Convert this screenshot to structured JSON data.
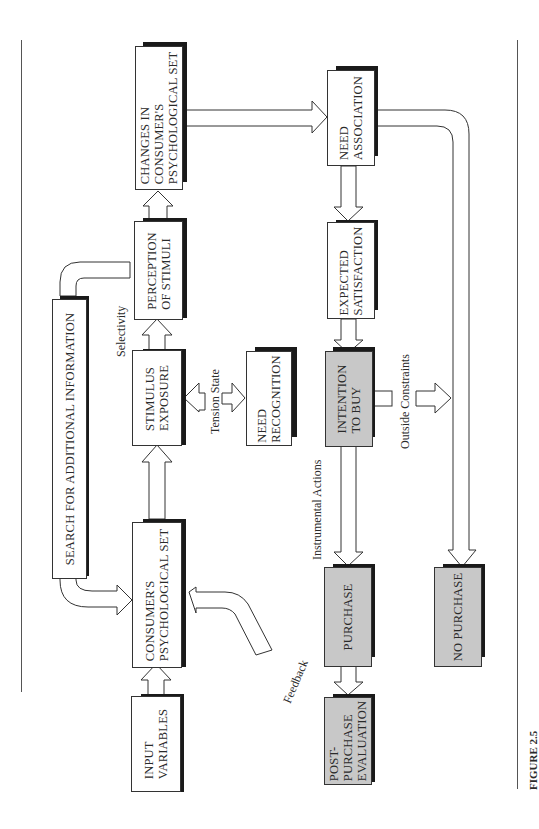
{
  "figure": {
    "caption": "FIGURE 2.5",
    "orientation": "rotated 90° (text reads bottom-to-top)",
    "colors": {
      "highlight_fill": "#c8c8c8",
      "shadow": "#1a1a1a",
      "line": "#333333"
    }
  },
  "nodes": {
    "input_variables": "INPUT\nVARIABLES",
    "consumers_psych_set": "CONSUMER'S\nPSYCHOLOGICAL SET",
    "stimulus_exposure": "STIMULUS\nEXPOSURE",
    "perception_of_stimuli": "PERCEPTION\nOF STIMULI",
    "changes_in_psych_set": "CHANGES IN\nCONSUMER'S\nPSYCHOLOGICAL SET",
    "search_for_info": "SEARCH FOR ADDITIONAL INFORMATION",
    "need_recognition": "NEED\nRECOGNITION",
    "need_association": "NEED\nASSOCIATION",
    "expected_satisfaction": "EXPECTED\nSATISFACTION",
    "intention_to_buy": "INTENTION\nTO BUY",
    "purchase": "PURCHASE",
    "post_purchase_evaluation": "POST-\nPURCHASE\nEVALUATION",
    "no_purchase": "NO PURCHASE"
  },
  "labels": {
    "selectivity": "Selectivity",
    "tension_state": "Tension State",
    "outside_constraints": "Outside Constraints",
    "instrumental_actions": "Instrumental Actions",
    "feedback": "Feedback"
  },
  "edges": [
    {
      "from": "INPUT VARIABLES",
      "to": "CONSUMER'S PSYCHOLOGICAL SET"
    },
    {
      "from": "CONSUMER'S PSYCHOLOGICAL SET",
      "to": "STIMULUS EXPOSURE"
    },
    {
      "from": "STIMULUS EXPOSURE",
      "to": "PERCEPTION OF STIMULI",
      "label": "Selectivity"
    },
    {
      "from": "STIMULUS EXPOSURE",
      "to": "NEED RECOGNITION",
      "label": "Tension State",
      "bidirectional": true
    },
    {
      "from": "PERCEPTION OF STIMULI",
      "to": "CHANGES IN CONSUMER'S PSYCHOLOGICAL SET"
    },
    {
      "from": "PERCEPTION OF STIMULI",
      "to": "CONSUMER'S PSYCHOLOGICAL SET",
      "via": "SEARCH FOR ADDITIONAL INFORMATION"
    },
    {
      "from": "CHANGES IN CONSUMER'S PSYCHOLOGICAL SET",
      "to": "NEED ASSOCIATION"
    },
    {
      "from": "NEED ASSOCIATION",
      "to": "EXPECTED SATISFACTION"
    },
    {
      "from": "NEED ASSOCIATION",
      "to": "NO PURCHASE"
    },
    {
      "from": "EXPECTED SATISFACTION",
      "to": "INTENTION TO BUY"
    },
    {
      "from": "INTENTION TO BUY",
      "to": "PURCHASE",
      "label": "Instrumental Actions"
    },
    {
      "from": "INTENTION TO BUY",
      "to": "NO PURCHASE",
      "label": "Outside Constraints"
    },
    {
      "from": "PURCHASE",
      "to": "POST-PURCHASE EVALUATION"
    },
    {
      "from": "POST-PURCHASE EVALUATION",
      "to": "CONSUMER'S PSYCHOLOGICAL SET",
      "label": "Feedback"
    }
  ]
}
